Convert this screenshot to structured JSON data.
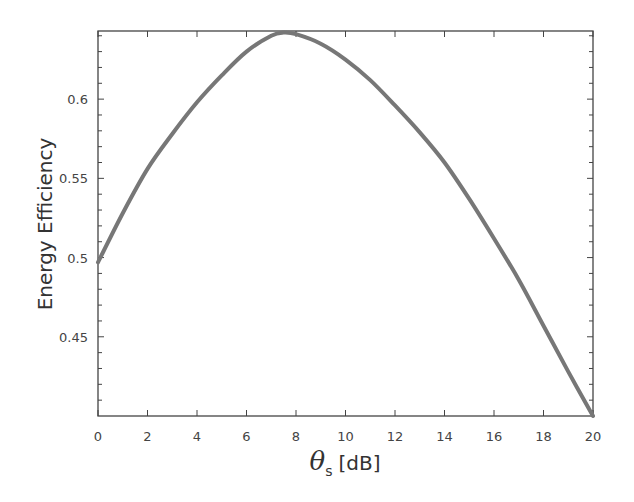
{
  "chart_data": {
    "type": "line",
    "title": "",
    "xlabel": "θs [dB]",
    "xlabel_parts": {
      "symbol": "θ",
      "subscript": "s",
      "unit": "[dB]"
    },
    "ylabel": "Energy Efficiency",
    "xlim": [
      0,
      20
    ],
    "ylim": [
      0.4,
      0.643
    ],
    "x_ticks": [
      0,
      2,
      4,
      6,
      8,
      10,
      12,
      14,
      16,
      18,
      20
    ],
    "x_tick_labels": [
      "0",
      "2",
      "4",
      "6",
      "8",
      "10",
      "12",
      "14",
      "16",
      "18",
      "20"
    ],
    "y_ticks": [
      0.45,
      0.5,
      0.55,
      0.6
    ],
    "y_tick_labels": [
      "0.45",
      "0.5",
      "0.55",
      "0.6"
    ],
    "grid": false,
    "legend": null,
    "series": [
      {
        "name": "Energy Efficiency",
        "color": "#777777",
        "x": [
          0,
          1,
          2,
          3,
          4,
          5,
          6,
          7,
          7.5,
          8,
          9,
          10,
          11,
          12,
          13,
          14,
          15,
          16,
          17,
          18,
          19,
          20
        ],
        "values": [
          0.497,
          0.528,
          0.556,
          0.578,
          0.598,
          0.615,
          0.63,
          0.64,
          0.642,
          0.641,
          0.635,
          0.625,
          0.612,
          0.596,
          0.579,
          0.56,
          0.537,
          0.512,
          0.486,
          0.457,
          0.428,
          0.4
        ]
      }
    ]
  }
}
